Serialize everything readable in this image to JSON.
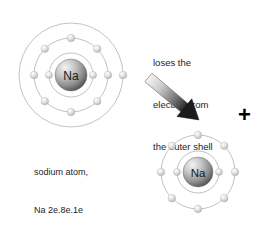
{
  "diagram": {
    "background_color": "#ffffff",
    "shell_color": "#a8a8a8",
    "electron_color": "#dcdcdc",
    "nucleus_color": "#8a8a8a",
    "text_color": "#1d1d1d",
    "plus_color": "#000000"
  },
  "atom": {
    "nucleus_label": "Na",
    "caption_line1": "sodium atom,",
    "caption_line2": "Na 2e.8e.1e",
    "shells": [
      {
        "name": "shell-1",
        "radius": 22,
        "electrons": 2,
        "electron_angles": [
          0,
          180
        ]
      },
      {
        "name": "shell-2",
        "radius": 37,
        "electrons": 8,
        "electron_angles": [
          0,
          45,
          90,
          135,
          180,
          225,
          270,
          315
        ]
      },
      {
        "name": "shell-3",
        "radius": 52,
        "electrons": 1,
        "electron_angles": [
          0
        ]
      }
    ],
    "electron_configuration": "2e.8e.1e",
    "center_x": 71,
    "center_y": 75
  },
  "ion": {
    "nucleus_label": "Na",
    "shells": [
      {
        "name": "shell-1",
        "radius": 21,
        "electrons": 2,
        "electron_angles": [
          0,
          180
        ]
      },
      {
        "name": "shell-2",
        "radius": 37,
        "electrons": 8,
        "electron_angles": [
          0,
          45,
          90,
          135,
          180,
          225,
          270,
          315
        ]
      }
    ],
    "electron_configuration": "2e.8e",
    "center_x": 198,
    "center_y": 172
  },
  "note": {
    "line1": "loses the",
    "line2": "electron from",
    "line3": "the outer shell"
  },
  "arrow": {
    "label": "electron-loss-arrow",
    "direction": "down-right",
    "angle_degrees": 40
  },
  "charge": {
    "symbol": "+"
  }
}
